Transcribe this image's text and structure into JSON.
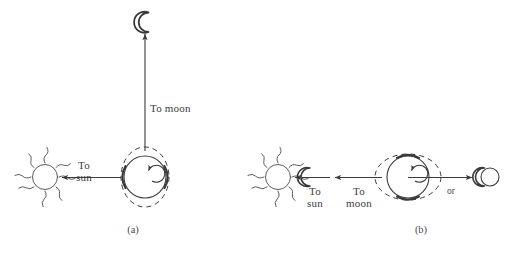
{
  "figure": {
    "background_color": "#ffffff",
    "stroke_color": "#3a3a3a",
    "panels": [
      {
        "id": "panel-a",
        "caption": "(a)",
        "description": "Quadrature configuration: neap tide. Sun to the left of Earth, Moon above Earth.",
        "labels": {
          "to_sun_line1": "To",
          "to_sun_line2": "sun",
          "to_moon": "To moon"
        },
        "objects": {
          "sun": "sun-with-rays",
          "earth": "earth-with-tidal-bulges",
          "moon": "crescent-moon",
          "earth_rotation": "counterclockwise-spin-arrow",
          "bulge_orientation": "vertical",
          "arrow_to_sun": "leftward-arrow",
          "arrow_to_moon": "upward-arrow"
        }
      },
      {
        "id": "panel-b",
        "caption": "(b)",
        "description": "Syzygy configuration: spring tide. Sun, Earth and Moon aligned; Moon may be on either side.",
        "labels": {
          "to_sun_line1": "To",
          "to_sun_line2": "sun",
          "to_moon_line1": "To",
          "to_moon_line2": "moon",
          "or": "or"
        },
        "objects": {
          "sun": "sun-with-rays",
          "earth": "earth-with-tidal-bulges",
          "moon_near_sun": "crescent-moon",
          "moon_opposite": "crescent-moon-with-disc",
          "earth_rotation": "counterclockwise-spin-arrow",
          "bulge_orientation": "horizontal",
          "arrow_to_sun": "leftward-arrow",
          "arrow_to_moon": "leftward-arrow",
          "arrow_to_far_moon": "rightward-arrow"
        }
      }
    ]
  }
}
